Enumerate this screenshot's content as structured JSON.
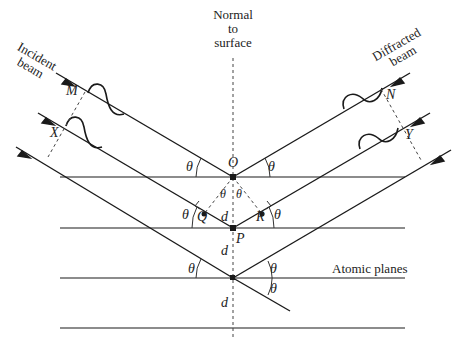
{
  "diagram": {
    "type": "bragg-diffraction",
    "labels": {
      "normal": [
        "Normal",
        "to",
        "surface"
      ],
      "incident": [
        "Incident",
        "beam"
      ],
      "diffracted": [
        "Diffracted",
        "beam"
      ],
      "atomic_planes": "Atomic planes"
    },
    "points": {
      "M": "M",
      "X": "X",
      "N": "N",
      "Y": "Y",
      "O": "O",
      "P": "P",
      "Q": "Q",
      "R": "R"
    },
    "angle_symbol": "θ",
    "spacing_symbol": "d",
    "colors": {
      "line": "#1a1a1a",
      "plane": "#555555",
      "background": "#ffffff"
    },
    "planes_count": 4
  }
}
